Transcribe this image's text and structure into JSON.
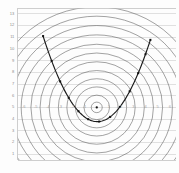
{
  "figure": {
    "title": "",
    "background": "#fdfdfd",
    "frame_color": "#b9b9b9"
  },
  "axes": {
    "y_tick_labels": [
      "13",
      "12",
      "11",
      "10",
      "9",
      "8",
      "7",
      "6",
      "5",
      "4",
      "3",
      "2",
      "1"
    ],
    "x_tick_labels": [
      "-6",
      "-5",
      "-4",
      "-3",
      "-2",
      "-1",
      "0",
      "1",
      "2",
      "3",
      "4",
      "5",
      "6"
    ],
    "y_label_color": "#8d8d8d",
    "x_label_color": "#a6a6a6"
  },
  "chart_data": {
    "type": "line",
    "title": "",
    "xlabel": "",
    "ylabel": "",
    "xlim": [
      -6.5,
      6.5
    ],
    "ylim": [
      0.5,
      13.5
    ],
    "grid": true,
    "grid_color": "#c8c8c8",
    "series": [
      {
        "name": "objective contours",
        "kind": "contour-circles",
        "center": [
          0,
          5
        ],
        "color": "#555555",
        "radii": [
          0.45,
          1.05,
          1.75,
          2.45,
          3.15,
          3.9,
          4.65,
          5.4,
          6.2,
          7.0,
          7.8,
          8.6
        ]
      },
      {
        "name": "constraint parabola",
        "kind": "curve",
        "color": "#1a1a1a",
        "x": [
          -4.4,
          -3.6,
          -2.8,
          -2.0,
          -1.2,
          -0.4,
          0.4,
          1.2,
          2.0,
          2.8,
          3.6,
          4.4
        ],
        "y": [
          11.1,
          9.1,
          7.3,
          5.8,
          4.6,
          3.8,
          3.8,
          4.3,
          5.3,
          6.7,
          8.5,
          10.7
        ]
      },
      {
        "name": "sample markers",
        "kind": "scatter",
        "color": "#111111",
        "x": [
          -4.4,
          -3.7,
          -3.0,
          -2.3,
          -1.5,
          -0.7,
          0.2,
          1.1,
          1.9,
          2.7,
          3.4,
          4.0,
          4.4
        ],
        "y": [
          11.1,
          9.4,
          7.7,
          6.3,
          5.0,
          4.0,
          3.8,
          4.2,
          5.1,
          6.5,
          7.9,
          9.4,
          11.1
        ]
      },
      {
        "name": "optimum center",
        "kind": "point",
        "color": "#111111",
        "x": [
          0
        ],
        "y": [
          5
        ]
      }
    ]
  }
}
